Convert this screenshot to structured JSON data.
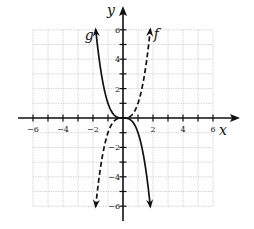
{
  "chart_data": {
    "type": "line",
    "title": "",
    "xlabel": "x",
    "ylabel": "y",
    "xlim": [
      -6,
      6
    ],
    "ylim": [
      -6,
      6
    ],
    "grid": true,
    "x_ticks": [
      -6,
      -4,
      -2,
      2,
      4,
      6
    ],
    "y_ticks": [
      6,
      4,
      2,
      -2,
      -4,
      -6
    ],
    "series": [
      {
        "name": "f",
        "style": "dashed",
        "equation": "y = x^3",
        "points": [
          [
            -1.82,
            -6
          ],
          [
            -1.5,
            -3.38
          ],
          [
            -1,
            -1
          ],
          [
            -0.5,
            -0.13
          ],
          [
            0,
            0
          ],
          [
            0.5,
            0.13
          ],
          [
            1,
            1
          ],
          [
            1.5,
            3.38
          ],
          [
            1.82,
            6
          ]
        ]
      },
      {
        "name": "g",
        "style": "solid",
        "equation": "y = -x^3",
        "points": [
          [
            -1.82,
            6
          ],
          [
            -1.5,
            3.38
          ],
          [
            -1,
            1
          ],
          [
            -0.5,
            0.13
          ],
          [
            0,
            0
          ],
          [
            0.5,
            -0.13
          ],
          [
            1,
            -1
          ],
          [
            1.5,
            -3.38
          ],
          [
            1.82,
            -6
          ]
        ]
      }
    ]
  },
  "labels": {
    "x_axis": "x",
    "y_axis": "y",
    "f": "f",
    "g": "g",
    "xticks": [
      "−6",
      "−4",
      "−2",
      "2",
      "4",
      "6"
    ],
    "yticks": [
      "6",
      "4",
      "2",
      "−2",
      "−4",
      "−6"
    ]
  }
}
